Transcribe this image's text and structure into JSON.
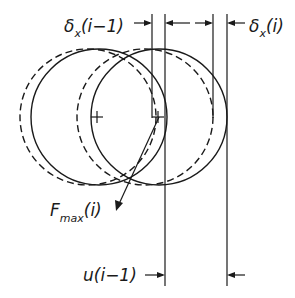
{
  "diagram": {
    "labels": {
      "delta_prev": {
        "main": "δ",
        "sub": "x",
        "tail": "(i−1)"
      },
      "delta_curr": {
        "main": "δ",
        "sub": "x",
        "tail": "(i)"
      },
      "force": {
        "main": "F",
        "sub": "max",
        "tail": "(i)"
      },
      "displacement": {
        "text": "u(i−1)"
      }
    },
    "circles": [
      {
        "id": "prev-dashed",
        "style": "dashed",
        "cx": 88,
        "cy": 117,
        "r": 68
      },
      {
        "id": "prev-solid",
        "style": "solid",
        "cx": 99,
        "cy": 117,
        "r": 68
      },
      {
        "id": "curr-dashed",
        "style": "dashed",
        "cx": 145,
        "cy": 117,
        "r": 68
      },
      {
        "id": "curr-solid",
        "style": "solid",
        "cx": 159,
        "cy": 117,
        "r": 68
      }
    ],
    "centers": [
      {
        "x": 97,
        "y": 117
      },
      {
        "x": 158,
        "y": 117
      }
    ],
    "stroke_color": "#1a1a1a"
  }
}
